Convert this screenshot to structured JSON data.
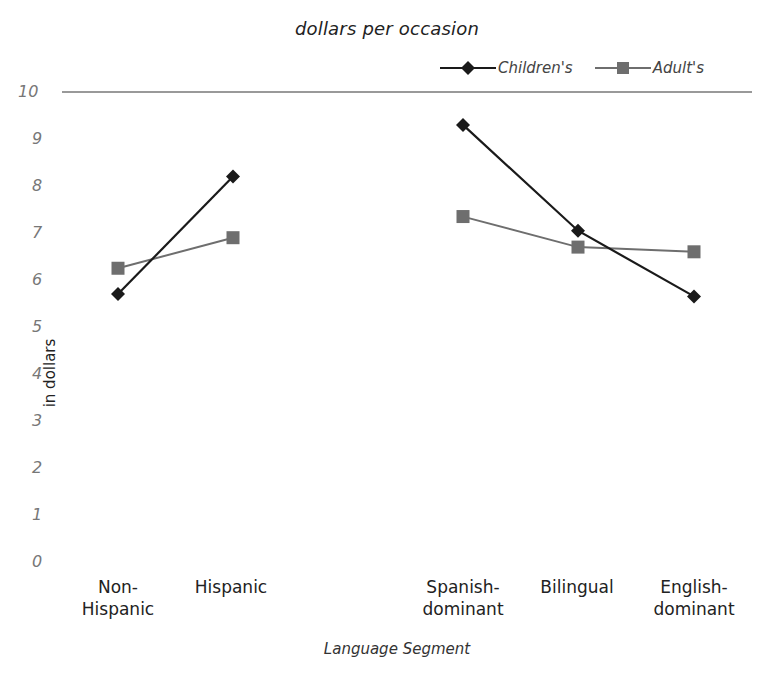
{
  "chart_data": {
    "type": "line",
    "title": "dollars per occasion",
    "xlabel": "Language Segment",
    "ylabel": "in dollars",
    "ylim": [
      0,
      10
    ],
    "yticks": [
      0,
      1,
      2,
      3,
      4,
      5,
      6,
      7,
      8,
      9,
      10
    ],
    "grid": false,
    "legend_position": "top-right",
    "categories": [
      "Non-Hispanic",
      "Hispanic",
      "Spanish-dominant",
      "Bilingual",
      "English-dominant"
    ],
    "category_groups": [
      [
        "Non-Hispanic",
        "Hispanic"
      ],
      [
        "Spanish-dominant",
        "Bilingual",
        "English-dominant"
      ]
    ],
    "series": [
      {
        "name": "Children's",
        "marker": "diamond",
        "color": "#1a1a1a",
        "values": [
          5.7,
          8.2,
          9.3,
          7.05,
          5.65
        ]
      },
      {
        "name": "Adult's",
        "marker": "square",
        "color": "#6e6e6e",
        "values": [
          6.25,
          6.9,
          7.35,
          6.7,
          6.6
        ]
      }
    ]
  },
  "labels": {
    "title": "dollars per occasion",
    "xlabel": "Language Segment",
    "ylabel": "in dollars",
    "legend": [
      "Children's",
      "Adult's"
    ],
    "categories": [
      "Non-\nHispanic",
      "Hispanic",
      "Spanish-\ndominant",
      "Bilingual",
      "English-\ndominant"
    ],
    "yticks": [
      "10",
      "9",
      "8",
      "7",
      "6",
      "5",
      "4",
      "3",
      "2",
      "1",
      "0"
    ]
  }
}
